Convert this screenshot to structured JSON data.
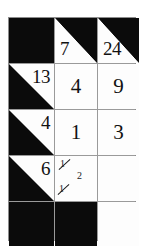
{
  "puzzle": {
    "type": "kakuro-grid",
    "title": "Kakuro partial grid",
    "columns": 3,
    "rows": 5,
    "colors": {
      "block": "#0b0b0b",
      "cell": "#fdfdfd",
      "gridline": "#9a9a9a",
      "ink": "#111111"
    },
    "cells": [
      {
        "r": 1,
        "c": 1,
        "kind": "block",
        "value": ""
      },
      {
        "r": 1,
        "c": 2,
        "kind": "clue-down",
        "value": "7"
      },
      {
        "r": 1,
        "c": 3,
        "kind": "clue-down",
        "value": "24"
      },
      {
        "r": 2,
        "c": 1,
        "kind": "clue-across",
        "value": "13"
      },
      {
        "r": 2,
        "c": 2,
        "kind": "answer",
        "value": "4"
      },
      {
        "r": 2,
        "c": 3,
        "kind": "answer",
        "value": "9"
      },
      {
        "r": 3,
        "c": 1,
        "kind": "clue-across",
        "value": "4"
      },
      {
        "r": 3,
        "c": 2,
        "kind": "answer",
        "value": "1"
      },
      {
        "r": 3,
        "c": 3,
        "kind": "answer",
        "value": "3"
      },
      {
        "r": 4,
        "c": 1,
        "kind": "clue-across",
        "value": "6"
      },
      {
        "r": 4,
        "c": 2,
        "kind": "pencil",
        "value": ""
      },
      {
        "r": 4,
        "c": 3,
        "kind": "empty",
        "value": ""
      },
      {
        "r": 5,
        "c": 1,
        "kind": "block",
        "value": ""
      },
      {
        "r": 5,
        "c": 2,
        "kind": "block",
        "value": ""
      },
      {
        "r": 5,
        "c": 3,
        "kind": "empty",
        "value": ""
      }
    ],
    "pencil_marks": [
      {
        "text": "1",
        "struck": true,
        "slot": "pm-a"
      },
      {
        "text": "2",
        "struck": false,
        "slot": "pm-b"
      },
      {
        "text": "1",
        "struck": true,
        "slot": "pm-c"
      }
    ]
  }
}
